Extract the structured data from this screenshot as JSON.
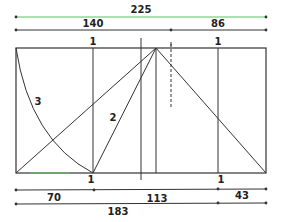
{
  "diagram": {
    "type": "golden-section-construction",
    "colors": {
      "line": "#333333",
      "accent_line": "#5fbf5f",
      "background": "#ffffff"
    },
    "top_dimensions": {
      "total": {
        "label": "225"
      },
      "left": {
        "label": "140"
      },
      "right": {
        "label": "86"
      }
    },
    "bottom_dimensions": {
      "left": {
        "label": "70"
      },
      "middle": {
        "label": "113"
      },
      "right": {
        "label": "43"
      },
      "combined": {
        "label": "183"
      }
    },
    "unit_marks": {
      "top_left": "1",
      "top_right": "1",
      "bottom_left": "1",
      "bottom_right": "1"
    },
    "curve_labels": {
      "arc": "3",
      "diagonal": "2"
    }
  }
}
